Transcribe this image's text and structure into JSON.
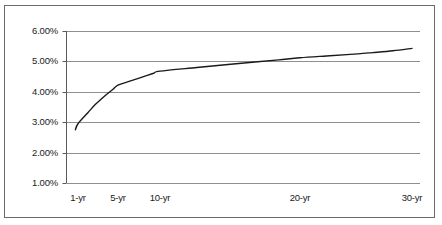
{
  "chart_data": {
    "type": "line",
    "title": "",
    "subtitle": "",
    "xlabel": "",
    "ylabel": "",
    "grid": true,
    "legend": false,
    "legend_position": "none",
    "ylim": [
      1.0,
      6.0
    ],
    "y_ticks": [
      "1.00%",
      "2.00%",
      "3.00%",
      "4.00%",
      "5.00%",
      "6.00%"
    ],
    "y_tick_values": [
      1.0,
      2.0,
      3.0,
      4.0,
      5.0,
      6.0
    ],
    "x_ticks": [
      "1-yr",
      "5-yr",
      "10-yr",
      "20-yr",
      "30-yr"
    ],
    "x_tick_values": [
      1,
      5,
      10,
      20,
      30
    ],
    "x_scale": "log",
    "series": [
      {
        "name": "Yield curve",
        "color": "#1a1a1a",
        "x": [
          0.9,
          1,
          1.5,
          2,
          3,
          4,
          5,
          6,
          7,
          8,
          9,
          10,
          12,
          14,
          16,
          18,
          20,
          22,
          24,
          26,
          28,
          30
        ],
        "values": [
          2.75,
          2.95,
          3.32,
          3.58,
          3.88,
          4.07,
          4.22,
          4.34,
          4.44,
          4.53,
          4.61,
          4.68,
          4.8,
          4.9,
          4.98,
          5.05,
          5.12,
          5.18,
          5.23,
          5.29,
          5.35,
          5.43
        ]
      }
    ]
  },
  "axes": {
    "gridline_color": "#8f8f8f",
    "axis_color": "#5a5a5a",
    "frame_color": "#6b6b6b",
    "background": "#ffffff"
  }
}
